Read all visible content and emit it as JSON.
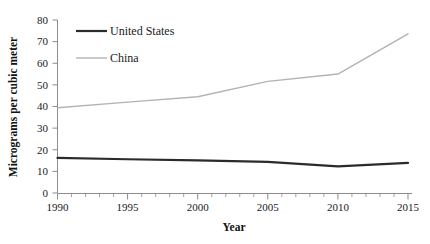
{
  "chart_data": {
    "type": "line",
    "title": "",
    "subtitle": "",
    "xlabel": "Year",
    "ylabel": "Micrograms per cubic meter",
    "x": [
      1990,
      1995,
      2000,
      2005,
      2010,
      2015
    ],
    "xlim": [
      1990,
      2015
    ],
    "ylim": [
      0,
      80
    ],
    "xticks": [
      "1990",
      "1995",
      "2000",
      "2005",
      "2010",
      "2015"
    ],
    "yticks": [
      "0",
      "10",
      "20",
      "30",
      "40",
      "50",
      "60",
      "70",
      "80"
    ],
    "x_minor_tick_step": 1,
    "y_tick_step": 10,
    "grid": false,
    "legend_position": "inside-top-left",
    "series": [
      {
        "name": "United States",
        "color": "#2b2b2b",
        "line_width": 2.2,
        "values": [
          16.2,
          15.6,
          15.1,
          14.4,
          12.3,
          13.9
        ]
      },
      {
        "name": "China",
        "color": "#b3b3b3",
        "line_width": 1.4,
        "values": [
          39.4,
          42.0,
          44.5,
          51.6,
          55.0,
          73.6
        ]
      }
    ]
  },
  "axis": {
    "x_title": "Year",
    "y_title": "Micrograms per cubic meter"
  },
  "legend": {
    "entries": [
      {
        "label": "United States",
        "color": "#2b2b2b"
      },
      {
        "label": "China",
        "color": "#b3b3b3"
      }
    ]
  },
  "colors": {
    "background": "#ffffff",
    "axis": "#8c8c8c",
    "text": "#1a1a1a",
    "united_states": "#2b2b2b",
    "china": "#b3b3b3"
  }
}
